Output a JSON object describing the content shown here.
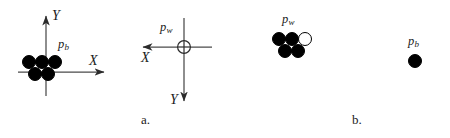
{
  "figure": {
    "caption_a": "a.",
    "caption_b": "b.",
    "ink_color": "#1a1a1a",
    "dot_fill_black": "#000000",
    "dot_fill_white": "#ffffff",
    "background": "#ffffff"
  },
  "panel_a": {
    "label": "a.",
    "coord_system_left": {
      "name": "robot-frame",
      "x_axis_label": "X",
      "y_axis_label": "Y",
      "x_axis_direction": "right",
      "y_axis_direction": "up",
      "origin": {
        "x": 46,
        "y": 72
      }
    },
    "coord_system_right": {
      "name": "world-frame",
      "x_axis_label": "X",
      "y_axis_label": "Y",
      "x_axis_direction": "left",
      "y_axis_direction": "down",
      "origin": {
        "x": 184,
        "y": 47
      },
      "origin_marker": "crosshair-circle",
      "origin_label": "p",
      "origin_label_sub": "w"
    },
    "cluster": {
      "label": "p",
      "label_sub": "b",
      "dots": [
        {
          "x": 29,
          "y": 62,
          "r": 7.0,
          "fill": "black"
        },
        {
          "x": 42,
          "y": 62,
          "r": 7.0,
          "fill": "black"
        },
        {
          "x": 55,
          "y": 62,
          "r": 7.0,
          "fill": "black"
        },
        {
          "x": 35,
          "y": 74,
          "r": 7.0,
          "fill": "black"
        },
        {
          "x": 48,
          "y": 74,
          "r": 7.0,
          "fill": "black"
        }
      ]
    }
  },
  "panel_b": {
    "label": "b.",
    "cluster": {
      "label": "p",
      "label_sub": "w",
      "dots": [
        {
          "x": 279,
          "y": 39,
          "r": 7.0,
          "fill": "black"
        },
        {
          "x": 292,
          "y": 39,
          "r": 7.0,
          "fill": "black"
        },
        {
          "x": 305,
          "y": 39,
          "r": 7.0,
          "fill": "white"
        },
        {
          "x": 285,
          "y": 51,
          "r": 7.0,
          "fill": "black"
        },
        {
          "x": 298,
          "y": 51,
          "r": 7.0,
          "fill": "black"
        }
      ]
    },
    "single_dot": {
      "label": "p",
      "label_sub": "b",
      "dot": {
        "x": 415,
        "y": 61,
        "r": 7.0,
        "fill": "black"
      }
    }
  }
}
